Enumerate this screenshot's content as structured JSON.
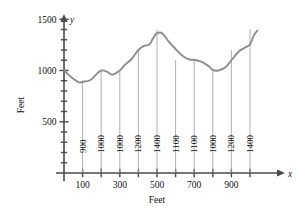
{
  "chart_data": {
    "type": "line",
    "title": "",
    "xlabel": "Feet",
    "ylabel": "Feet",
    "xlim": [
      0,
      1100
    ],
    "ylim": [
      0,
      1700
    ],
    "grid": false,
    "legend": null,
    "x_axis_var": "x",
    "y_axis_var": "y",
    "xticks": [
      0,
      100,
      200,
      300,
      400,
      500,
      600,
      700,
      800,
      900,
      1000
    ],
    "xtick_labels": [
      "",
      "100",
      "",
      "300",
      "",
      "500",
      "",
      "700",
      "",
      "900",
      ""
    ],
    "yticks": [
      100,
      200,
      300,
      400,
      500,
      600,
      700,
      800,
      900,
      1000,
      1100,
      1200,
      1300,
      1400,
      1500
    ],
    "ytick_labels": [
      "",
      "",
      "",
      "",
      "500",
      "",
      "",
      "",
      "",
      "1000",
      "",
      "",
      "",
      "",
      "1500"
    ],
    "measurements": {
      "x": [
        100,
        200,
        300,
        400,
        500,
        600,
        700,
        800,
        900,
        1000
      ],
      "values": [
        900,
        1000,
        1000,
        1200,
        1400,
        1100,
        1100,
        1000,
        1200,
        1400
      ],
      "labels": [
        "900",
        "1000",
        "1000",
        "1200",
        "1400",
        "1100",
        "1100",
        "1000",
        "1200",
        "1400"
      ]
    },
    "series": [
      {
        "name": "elevation-profile",
        "color": "#8d8d8d",
        "x": [
          0,
          40,
          80,
          100,
          140,
          170,
          200,
          235,
          260,
          300,
          330,
          360,
          400,
          430,
          460,
          480,
          500,
          530,
          560,
          600,
          640,
          680,
          700,
          740,
          780,
          800,
          830,
          870,
          900,
          940,
          970,
          1000,
          1020,
          1040
        ],
        "y": [
          1000,
          935,
          885,
          890,
          905,
          955,
          1000,
          985,
          960,
          1000,
          1060,
          1105,
          1200,
          1240,
          1255,
          1320,
          1365,
          1360,
          1290,
          1210,
          1140,
          1105,
          1105,
          1085,
          1040,
          1005,
          1000,
          1035,
          1100,
          1185,
          1220,
          1255,
          1340,
          1390
        ]
      }
    ]
  }
}
